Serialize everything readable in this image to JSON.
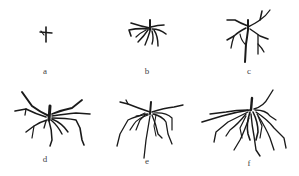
{
  "figure": {
    "panels": [
      {
        "id": "a",
        "label": "a",
        "description": "seedling with very small root"
      },
      {
        "id": "b",
        "label": "b",
        "description": "short spreading root system"
      },
      {
        "id": "c",
        "label": "c",
        "description": "branched root system with taproot"
      },
      {
        "id": "d",
        "label": "d",
        "description": "wide spreading root system"
      },
      {
        "id": "e",
        "label": "e",
        "description": "broad fibrous root system"
      },
      {
        "id": "f",
        "label": "f",
        "description": "dense extensive root system"
      }
    ],
    "stroke_color": "#1a1a1a",
    "background": "#ffffff"
  }
}
